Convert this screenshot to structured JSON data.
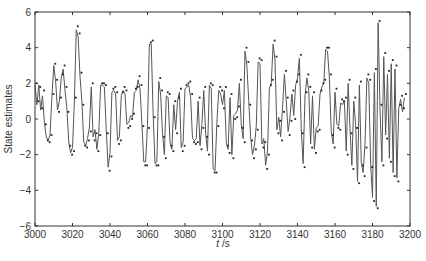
{
  "chart_data": {
    "type": "line",
    "title": "",
    "xlabel": "t /s",
    "ylabel": "State estimates",
    "xlim": [
      3000,
      3200
    ],
    "ylim": [
      -6,
      6
    ],
    "xticks": [
      3000,
      3020,
      3040,
      3060,
      3080,
      3100,
      3120,
      3140,
      3160,
      3180,
      3200
    ],
    "yticks": [
      -6,
      -4,
      -2,
      0,
      2,
      4,
      6
    ],
    "grid": false,
    "legend": null,
    "series": [
      {
        "name": "State estimate (line)",
        "style": "line",
        "color": "#555555",
        "x_start": 3000,
        "x_step": 1,
        "values": [
          1.9,
          0.8,
          1.9,
          0.5,
          1.3,
          -0.2,
          -1.0,
          -1.2,
          -0.9,
          1.2,
          3.0,
          2.1,
          0.5,
          1.0,
          2.3,
          2.8,
          1.6,
          0.6,
          -1.3,
          -1.9,
          -1.6,
          1.0,
          5.0,
          4.6,
          2.4,
          1.0,
          -1.3,
          -1.5,
          -1.1,
          -0.5,
          1.8,
          -1.0,
          -0.6,
          -1.7,
          -0.8,
          1.9,
          1.9,
          1.8,
          -0.6,
          -2.7,
          -1.9,
          1.5,
          1.6,
          1.4,
          -1.2,
          -1.0,
          1.3,
          1.6,
          1.4,
          -0.3,
          -0.2,
          0.2,
          0.1,
          1.5,
          1.6,
          2.2,
          1.7,
          -0.2,
          -2.4,
          -2.4,
          -0.3,
          4.2,
          4.2,
          0.3,
          -2.5,
          -2.4,
          2.1,
          1.4,
          -0.8,
          -2.0,
          1.3,
          1.2,
          -1.3,
          -1.7,
          0.8,
          -0.6,
          1.0,
          1.5,
          -1.6,
          -1.3,
          1.7,
          1.8,
          1.9,
          1.2,
          -1.1,
          -1.2,
          -1.1,
          1.0,
          -1.5,
          -0.3,
          1.6,
          -0.8,
          -1.8,
          1.9,
          1.7,
          -2.8,
          -2.9,
          -0.2,
          1.6,
          1.4,
          0.8,
          1.6,
          -1.3,
          -1.7,
          1.2,
          -2.0,
          0.2,
          0.3,
          0.5,
          2.0,
          -0.3,
          -1.1,
          3.8,
          3.0,
          1.0,
          -1.0,
          -2.0,
          -1.5,
          -0.4,
          3.2,
          3.1,
          -1.4,
          -1.1,
          -2.6,
          -1.8,
          1.7,
          2.0,
          4.2,
          3.3,
          -0.6,
          0.1,
          -1.0,
          0.6,
          2.5,
          1.0,
          -0.7,
          0.1,
          1.4,
          0.2,
          1.9,
          2.3,
          3.4,
          -0.6,
          -2.5,
          1.3,
          2.3,
          1.6,
          -1.4,
          1.3,
          -1.7,
          -0.5,
          -0.4,
          1.4,
          1.8,
          2.0,
          3.9,
          3.8,
          2.3,
          -0.7,
          -1.4,
          1.5,
          -0.3,
          -0.4,
          0.9,
          0.8,
          1.0,
          -1.8,
          2.0,
          -0.6,
          -2.6,
          1.0,
          -0.3,
          -3.5,
          1.9,
          -2.4,
          -3.0,
          -1.4,
          2.3,
          2.0,
          -2.5,
          -4.4,
          2.6,
          -4.9,
          5.4,
          0.6,
          -2.4,
          3.5,
          -0.9,
          2.5,
          -2.2,
          3.1,
          -3.0,
          2.8,
          -3.3,
          0.6,
          1.1,
          0.4,
          1.2
        ]
      },
      {
        "name": "Observations (points)",
        "style": "markers",
        "color": "#222222",
        "x_start": 3000,
        "x_step": 1,
        "values": [
          2.0,
          1.0,
          1.8,
          0.6,
          1.6,
          -0.3,
          -1.2,
          -1.3,
          -0.9,
          1.4,
          3.1,
          2.2,
          0.4,
          1.2,
          2.5,
          3.0,
          1.8,
          0.4,
          -1.5,
          -2.0,
          -1.8,
          1.2,
          5.2,
          4.8,
          2.6,
          0.8,
          -1.5,
          -1.6,
          -1.2,
          -0.7,
          2.0,
          -1.2,
          -0.8,
          -1.8,
          -0.9,
          2.0,
          2.0,
          1.9,
          -0.8,
          -2.9,
          -2.1,
          1.7,
          1.8,
          1.5,
          -1.4,
          -1.2,
          1.5,
          1.8,
          1.6,
          -0.5,
          -0.4,
          0.0,
          0.3,
          1.7,
          1.8,
          2.4,
          1.9,
          -0.4,
          -2.6,
          -2.6,
          -0.5,
          4.3,
          4.4,
          0.1,
          -2.6,
          -2.6,
          2.3,
          1.6,
          -1.0,
          -2.2,
          1.5,
          1.4,
          -1.5,
          -1.8,
          1.0,
          -0.8,
          1.2,
          1.7,
          -1.8,
          -1.5,
          1.9,
          2.0,
          2.1,
          1.4,
          -1.3,
          -1.4,
          -1.3,
          1.2,
          -1.7,
          -0.5,
          1.8,
          -1.0,
          -2.0,
          2.0,
          1.9,
          -3.0,
          -3.0,
          -0.4,
          1.8,
          1.6,
          0.6,
          1.8,
          -1.5,
          -1.9,
          1.4,
          -2.2,
          0.0,
          0.1,
          0.7,
          2.2,
          -0.5,
          -1.3,
          4.0,
          3.2,
          0.8,
          -1.2,
          -2.2,
          -1.7,
          -0.6,
          3.4,
          3.3,
          -1.6,
          -1.3,
          -2.8,
          -2.0,
          1.9,
          2.2,
          4.4,
          3.5,
          -0.8,
          -0.1,
          -1.2,
          0.4,
          2.7,
          1.2,
          -0.9,
          -0.1,
          1.6,
          0.0,
          2.1,
          2.5,
          3.6,
          -0.8,
          -2.7,
          1.5,
          2.5,
          1.8,
          -1.6,
          1.5,
          -1.9,
          -0.7,
          -0.6,
          1.6,
          2.0,
          2.2,
          4.0,
          4.0,
          2.5,
          -0.9,
          -1.6,
          1.7,
          -0.5,
          -0.6,
          1.1,
          1.0,
          1.2,
          -2.0,
          2.2,
          -0.8,
          -2.8,
          1.2,
          -0.5,
          -3.6,
          2.1,
          -2.6,
          -3.2,
          -1.6,
          2.5,
          2.2,
          -2.7,
          -4.6,
          2.8,
          -5.0,
          5.5,
          0.8,
          -2.6,
          3.7,
          -1.1,
          2.7,
          -2.4,
          3.3,
          -3.2,
          3.0,
          -3.5,
          0.8,
          1.3,
          0.6,
          1.4
        ]
      }
    ]
  },
  "labels": {
    "ylabel": "State estimates",
    "xlabel_italic": "t",
    "xlabel_unit": " /s"
  }
}
